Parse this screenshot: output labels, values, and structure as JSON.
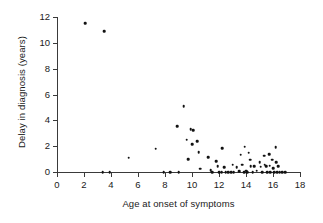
{
  "chart_data": {
    "type": "scatter",
    "title": "",
    "xlabel": "Age at onset of symptoms",
    "ylabel": "Delay in diagnosis (years)",
    "xlim": [
      0,
      18
    ],
    "ylim": [
      0,
      12
    ],
    "xticks": [
      0,
      2,
      4,
      6,
      8,
      10,
      12,
      14,
      16,
      18
    ],
    "yticks": [
      0,
      2,
      4,
      6,
      8,
      10,
      12
    ],
    "grid": false,
    "legend": false,
    "marker_color": "#121212",
    "axis_color": "#3a3a3a",
    "points": [
      {
        "x": 2.1,
        "y": 11.5
      },
      {
        "x": 3.5,
        "y": 10.9
      },
      {
        "x": 3.4,
        "y": 0.0
      },
      {
        "x": 3.9,
        "y": 0.0
      },
      {
        "x": 5.3,
        "y": 1.1
      },
      {
        "x": 7.3,
        "y": 1.8
      },
      {
        "x": 7.9,
        "y": 0.0
      },
      {
        "x": 8.4,
        "y": 0.0
      },
      {
        "x": 8.9,
        "y": 3.55
      },
      {
        "x": 9.0,
        "y": 0.0
      },
      {
        "x": 9.4,
        "y": 5.1
      },
      {
        "x": 9.6,
        "y": 2.5
      },
      {
        "x": 9.7,
        "y": 1.0
      },
      {
        "x": 9.9,
        "y": 3.3
      },
      {
        "x": 10.1,
        "y": 3.25
      },
      {
        "x": 10.0,
        "y": 2.15
      },
      {
        "x": 10.4,
        "y": 2.4
      },
      {
        "x": 10.5,
        "y": 1.55
      },
      {
        "x": 10.6,
        "y": 0.25
      },
      {
        "x": 11.2,
        "y": 1.15
      },
      {
        "x": 11.4,
        "y": 0.15
      },
      {
        "x": 11.5,
        "y": 0.0
      },
      {
        "x": 11.8,
        "y": 0.85
      },
      {
        "x": 11.9,
        "y": 0.45
      },
      {
        "x": 12.0,
        "y": 0.0
      },
      {
        "x": 12.2,
        "y": 0.0
      },
      {
        "x": 12.25,
        "y": 1.85
      },
      {
        "x": 12.4,
        "y": 0.35
      },
      {
        "x": 12.5,
        "y": 0.0
      },
      {
        "x": 12.7,
        "y": 0.0
      },
      {
        "x": 12.9,
        "y": 0.0
      },
      {
        "x": 13.0,
        "y": 0.55
      },
      {
        "x": 13.1,
        "y": 0.0
      },
      {
        "x": 13.3,
        "y": 0.35
      },
      {
        "x": 13.5,
        "y": 0.05
      },
      {
        "x": 13.6,
        "y": 1.35
      },
      {
        "x": 13.7,
        "y": 0.55
      },
      {
        "x": 13.85,
        "y": 0.0
      },
      {
        "x": 13.9,
        "y": 1.95
      },
      {
        "x": 14.0,
        "y": 0.1
      },
      {
        "x": 14.1,
        "y": 0.0
      },
      {
        "x": 14.2,
        "y": 1.5
      },
      {
        "x": 14.3,
        "y": 0.95
      },
      {
        "x": 14.35,
        "y": 0.45
      },
      {
        "x": 14.5,
        "y": 0.0
      },
      {
        "x": 14.6,
        "y": 0.45
      },
      {
        "x": 14.8,
        "y": 0.1
      },
      {
        "x": 15.0,
        "y": 0.75
      },
      {
        "x": 15.1,
        "y": 0.4
      },
      {
        "x": 15.2,
        "y": 0.0
      },
      {
        "x": 15.35,
        "y": 1.25
      },
      {
        "x": 15.4,
        "y": 0.55
      },
      {
        "x": 15.5,
        "y": 0.45
      },
      {
        "x": 15.55,
        "y": 0.0
      },
      {
        "x": 15.7,
        "y": 1.4
      },
      {
        "x": 15.75,
        "y": 0.5
      },
      {
        "x": 15.8,
        "y": 0.0
      },
      {
        "x": 15.95,
        "y": 0.95
      },
      {
        "x": 16.0,
        "y": 0.3
      },
      {
        "x": 16.1,
        "y": 0.0
      },
      {
        "x": 16.2,
        "y": 1.9
      },
      {
        "x": 16.25,
        "y": 0.75
      },
      {
        "x": 16.3,
        "y": 0.0
      },
      {
        "x": 16.4,
        "y": 0.45
      },
      {
        "x": 16.5,
        "y": 0.0
      },
      {
        "x": 16.7,
        "y": 0.0
      },
      {
        "x": 16.9,
        "y": 0.0
      }
    ]
  }
}
